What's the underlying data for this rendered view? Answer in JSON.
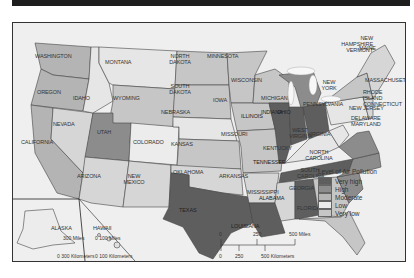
{
  "legend": {
    "title": "Level of Air Pollution",
    "items": [
      {
        "label": "Very high",
        "color": "#5e5e5e"
      },
      {
        "label": "High",
        "color": "#8c8c8c"
      },
      {
        "label": "Moderate",
        "color": "#b4b4b4"
      },
      {
        "label": "Low",
        "color": "#d6d6d6"
      },
      {
        "label": "Very low",
        "color": "#c6c6c6"
      }
    ]
  },
  "states": {
    "washington": "WASHINGTON",
    "oregon": "OREGON",
    "california": "CALIFORNIA",
    "nevada": "NEVADA",
    "idaho": "IDAHO",
    "montana": "MONTANA",
    "wyoming": "WYOMING",
    "utah": "UTAH",
    "colorado": "COLORADO",
    "arizona": "ARIZONA",
    "new_mexico": "NEW MEXICO",
    "north_dakota": "NORTH DAKOTA",
    "south_dakota": "SOUTH DAKOTA",
    "nebraska": "NEBRASKA",
    "kansas": "KANSAS",
    "oklahoma": "OKLAHOMA",
    "texas": "TEXAS",
    "minnesota": "MINNESOTA",
    "iowa": "IOWA",
    "missouri": "MISSOURI",
    "arkansas": "ARKANSAS",
    "louisiana": "LOUISIANA",
    "wisconsin": "WISCONSIN",
    "illinois": "ILLINOIS",
    "michigan": "MICHIGAN",
    "indiana": "INDIANA",
    "ohio": "OHIO",
    "kentucky": "KENTUCKY",
    "tennessee": "TENNESSEE",
    "mississippi": "MISSISSIPPI",
    "alabama": "ALABAMA",
    "georgia": "GEORGIA",
    "florida": "FLORIDA",
    "south_carolina": "SOUTH CAROLINA",
    "north_carolina": "NORTH CAROLINA",
    "virginia": "VIRGINIA",
    "west_virginia": "WEST VIRGINIA",
    "pennsylvania": "PENNSYLVANIA",
    "new_york": "NEW YORK",
    "new_jersey": "NEW JERSEY",
    "delaware_maryland": "DELAWARE MARYLAND",
    "rhode_island_connecticut": "RHODE ISLAND CONNECTICUT",
    "massachusetts": "MASSACHUSETTS",
    "new_hampshire_vermont": "NEW HAMPSHIRE VERMONT",
    "maine": "MAINE",
    "alaska": "ALASKA",
    "hawaii": "HAWAII"
  },
  "scales": {
    "main_miles": [
      "0",
      "250",
      "500 Miles"
    ],
    "main_km": [
      "0",
      "250",
      "500 Kilometers"
    ],
    "alaska_miles": "300 Miles",
    "alaska_km": "0  300 Kilometers",
    "hawaii_miles": "0   100 Miles",
    "hawaii_km": "0  100 Kilometers"
  }
}
